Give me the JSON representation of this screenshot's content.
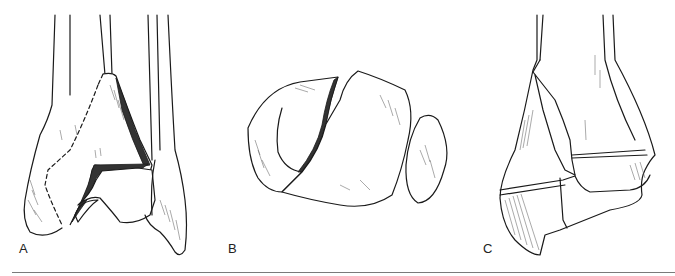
{
  "figure": {
    "panels": [
      {
        "id": "A",
        "label": "A",
        "description": "Anterior view of distal tibia and fibula with fracture fragment outlined by dashed line"
      },
      {
        "id": "B",
        "label": "B",
        "description": "Axial view of distal tibial articular surface with fracture and fibula"
      },
      {
        "id": "C",
        "label": "C",
        "description": "Distal tibia with fracture lines through epiphysis and metaphysis"
      }
    ]
  }
}
